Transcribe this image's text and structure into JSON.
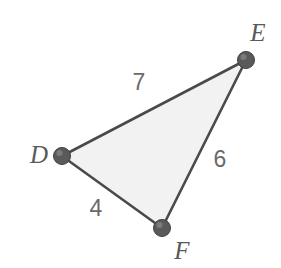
{
  "figure": {
    "kind": "triangle-diagram",
    "background_color": "#ffffff",
    "fill_color": "#f2f2f2",
    "stroke_color": "#4a4a4a",
    "label_color": "#5a5a5a",
    "number_color": "#6a6a6a",
    "vertices": [
      {
        "name": "D",
        "label": "D",
        "x": 62,
        "y": 156,
        "label_x": 39,
        "label_y": 163
      },
      {
        "name": "E",
        "label": "E",
        "x": 246,
        "y": 60,
        "label_x": 258,
        "label_y": 41
      },
      {
        "name": "F",
        "label": "F",
        "x": 162,
        "y": 228,
        "label_x": 182,
        "label_y": 259
      }
    ],
    "sides": [
      {
        "name": "DE",
        "length_label": "7",
        "from": "D",
        "to": "E",
        "label_x": 139,
        "label_y": 90
      },
      {
        "name": "EF",
        "length_label": "6",
        "from": "E",
        "to": "F",
        "label_x": 220,
        "label_y": 167
      },
      {
        "name": "DF",
        "length_label": "4",
        "from": "D",
        "to": "F",
        "label_x": 96,
        "label_y": 216
      }
    ]
  }
}
